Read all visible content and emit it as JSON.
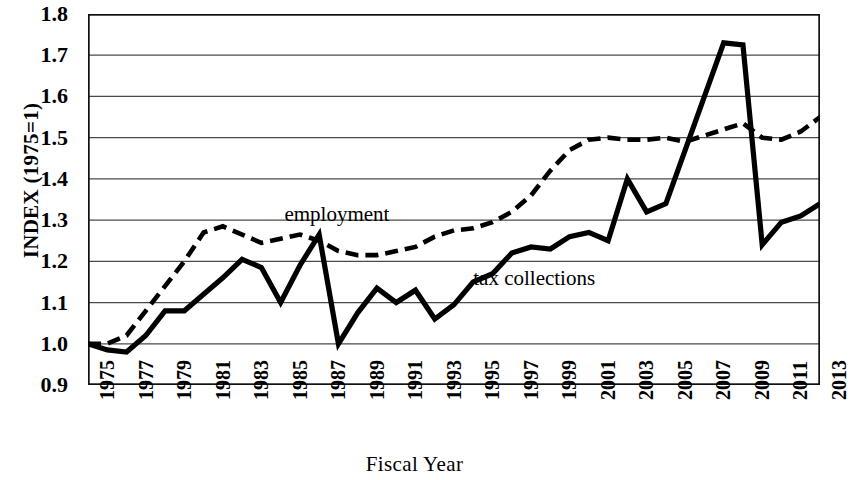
{
  "chart_data": {
    "type": "line",
    "title": "",
    "xlabel": "Fiscal Year",
    "ylabel": "INDEX (1975=1)",
    "ylim": [
      0.9,
      1.8
    ],
    "xlim": [
      1975,
      2013
    ],
    "grid": true,
    "legend_position": "inline-annotations",
    "y_ticks": [
      "0.9",
      "1.0",
      "1.1",
      "1.2",
      "1.3",
      "1.4",
      "1.5",
      "1.6",
      "1.7",
      "1.8"
    ],
    "y_tick_values": [
      0.9,
      1.0,
      1.1,
      1.2,
      1.3,
      1.4,
      1.5,
      1.6,
      1.7,
      1.8
    ],
    "x_ticks": [
      "1975",
      "1977",
      "1979",
      "1981",
      "1983",
      "1985",
      "1987",
      "1989",
      "1991",
      "1993",
      "1995",
      "1997",
      "1999",
      "2001",
      "2003",
      "2005",
      "2007",
      "2009",
      "2011",
      "2013"
    ],
    "x": [
      1975,
      1976,
      1977,
      1978,
      1979,
      1980,
      1981,
      1982,
      1983,
      1984,
      1985,
      1986,
      1987,
      1988,
      1989,
      1990,
      1991,
      1992,
      1993,
      1994,
      1995,
      1996,
      1997,
      1998,
      1999,
      2000,
      2001,
      2002,
      2003,
      2004,
      2005,
      2006,
      2007,
      2008,
      2009,
      2010,
      2011,
      2012,
      2013
    ],
    "series": [
      {
        "name": "employment",
        "style": "dashed",
        "color": "#000000",
        "values": [
          1.0,
          1.0,
          1.02,
          1.08,
          1.14,
          1.2,
          1.27,
          1.285,
          1.265,
          1.245,
          1.255,
          1.265,
          1.25,
          1.225,
          1.215,
          1.215,
          1.225,
          1.235,
          1.26,
          1.275,
          1.28,
          1.295,
          1.32,
          1.36,
          1.42,
          1.47,
          1.495,
          1.5,
          1.495,
          1.495,
          1.5,
          1.49,
          1.505,
          1.52,
          1.535,
          1.5,
          1.495,
          1.515,
          1.55
        ]
      },
      {
        "name": "tax collections",
        "style": "solid",
        "color": "#000000",
        "values": [
          1.0,
          0.985,
          0.98,
          1.02,
          1.08,
          1.08,
          1.12,
          1.16,
          1.205,
          1.185,
          1.1,
          1.19,
          1.265,
          1.0,
          1.075,
          1.135,
          1.1,
          1.13,
          1.06,
          1.095,
          1.15,
          1.17,
          1.22,
          1.235,
          1.23,
          1.26,
          1.27,
          1.25,
          1.4,
          1.32,
          1.34,
          1.47,
          1.6,
          1.73,
          1.725,
          1.24,
          1.295,
          1.31,
          1.34
        ]
      }
    ],
    "annotations": [
      {
        "text": "employment",
        "x_pos": 1985.2,
        "y_pos": 1.345
      },
      {
        "text": "tax collections",
        "x_pos": 1995.0,
        "y_pos": 1.188
      }
    ]
  },
  "axis": {
    "y_title": "INDEX (1975=1)",
    "x_title": "Fiscal Year"
  }
}
